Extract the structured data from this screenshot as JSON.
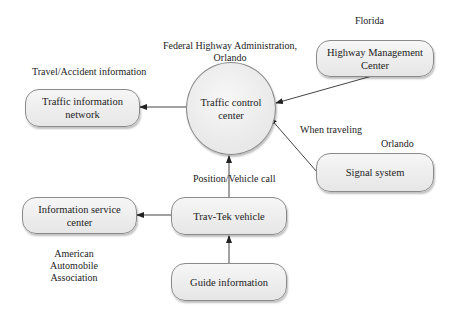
{
  "nodes": {
    "traffic_control_center": "Traffic control\ncenter",
    "traffic_information_network": "Traffic information\nnetwork",
    "highway_management_center": "Highway Management\nCenter",
    "signal_system": "Signal system",
    "information_service_center": "Information service\ncenter",
    "travtek_vehicle": "Trav-Tek vehicle",
    "guide_information": "Guide information"
  },
  "labels": {
    "fhwa": "Federal Highway Administration,\nOrlando",
    "travel_accident": "Travel/Accident information",
    "florida": "Florida",
    "when_traveling": "When traveling",
    "orlando": "Orlando",
    "position_vehicle_call": "Position/Vehicle call",
    "aaa": "American Automobile\nAssociation"
  },
  "colors": {
    "node_fill": "#eeeeee",
    "node_border": "#8a8a8a",
    "edge": "#333333"
  }
}
